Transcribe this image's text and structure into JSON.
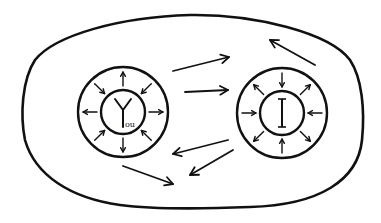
{
  "diagram": {
    "background": "#ffffff",
    "ink_color": "#111111",
    "boundary": {
      "label": "",
      "shape": "rounded-blob"
    },
    "nodes": [
      {
        "id": "you",
        "label_main": "Y",
        "label_sub": "ou",
        "full_label": "You",
        "cx": 123,
        "cy": 112,
        "outer_r": 45,
        "inner_r": 22,
        "radial_arrows": [
          {
            "angle": -90,
            "dir": "out"
          },
          {
            "angle": -45,
            "dir": "in"
          },
          {
            "angle": 0,
            "dir": "out"
          },
          {
            "angle": 45,
            "dir": "in"
          },
          {
            "angle": 90,
            "dir": "out"
          },
          {
            "angle": 135,
            "dir": "in"
          },
          {
            "angle": 180,
            "dir": "out"
          },
          {
            "angle": -135,
            "dir": "in"
          }
        ]
      },
      {
        "id": "i",
        "label_main": "I",
        "label_sub": "",
        "full_label": "I",
        "cx": 282,
        "cy": 113,
        "outer_r": 45,
        "inner_r": 22,
        "radial_arrows": [
          {
            "angle": -90,
            "dir": "in"
          },
          {
            "angle": -45,
            "dir": "out"
          },
          {
            "angle": 0,
            "dir": "in"
          },
          {
            "angle": 45,
            "dir": "out"
          },
          {
            "angle": 90,
            "dir": "in"
          },
          {
            "angle": 135,
            "dir": "out"
          },
          {
            "angle": 180,
            "dir": "in"
          },
          {
            "angle": -135,
            "dir": "out"
          }
        ]
      }
    ],
    "edges": [
      {
        "from": "you",
        "to": "i",
        "x1": 173,
        "y1": 71,
        "x2": 229,
        "y2": 57
      },
      {
        "from": "you",
        "to": "i",
        "x1": 185,
        "y1": 92,
        "x2": 228,
        "y2": 90
      },
      {
        "from": "i",
        "to": "you",
        "x1": 228,
        "y1": 140,
        "x2": 173,
        "y2": 154
      },
      {
        "from": "i",
        "to": "you",
        "x1": 233,
        "y1": 150,
        "x2": 190,
        "y2": 175
      },
      {
        "from": "you",
        "to": "space",
        "x1": 123,
        "y1": 166,
        "x2": 173,
        "y2": 184
      },
      {
        "from": "i",
        "to": "space",
        "x1": 315,
        "y1": 65,
        "x2": 270,
        "y2": 40
      }
    ]
  }
}
